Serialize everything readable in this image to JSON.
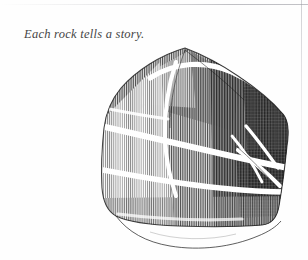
{
  "page": {
    "width": 308,
    "height": 260,
    "background_color": "#fefefe",
    "medium": "pen-and-ink engraving on scanned book page"
  },
  "caption": {
    "text": "Each rock tells a story.",
    "style": "italic serif",
    "color": "#2a2a2a"
  },
  "illustration": {
    "subject": "rock",
    "alt_text": "Pen-and-ink engraving of an angular boulder with quartz veins",
    "ink_color": "#1d1d1d",
    "technique": "vertical line hatching",
    "ground_line_label": "ground-contour",
    "highlight_color": "#ffffff",
    "shadow_side": "right"
  }
}
